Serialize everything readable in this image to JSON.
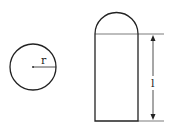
{
  "diagram": {
    "circle": {
      "label": "r",
      "description": "circle with radius r"
    },
    "capsule": {
      "label": "l",
      "description": "cylinder with hemispherical cap, length l"
    },
    "colors": {
      "stroke": "#222222",
      "background": "#ffffff"
    }
  }
}
